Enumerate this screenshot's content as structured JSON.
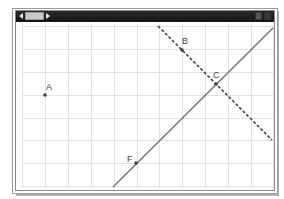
{
  "window": {
    "titlebar": {
      "background": "#1e1e1e",
      "scroll_left_icon": "triangle-left",
      "scroll_right_icon": "triangle-right",
      "buttons": [
        "minimize",
        "close"
      ]
    }
  },
  "canvas": {
    "grid": {
      "x_lines": [
        22,
        45,
        68,
        91,
        114,
        137,
        159,
        182,
        205,
        228,
        251,
        273
      ],
      "y_lines": [
        26,
        49,
        72,
        95,
        118,
        140,
        163,
        186
      ],
      "color": "#e2e2e2"
    },
    "lines": [
      {
        "name": "solid-line-FC",
        "x1": 113,
        "y1": 187,
        "x2": 273,
        "y2": 28,
        "style": "solid",
        "color": "#707070"
      },
      {
        "name": "dashed-line-BC",
        "x1": 158,
        "y1": 26,
        "x2": 272,
        "y2": 140,
        "style": "dashed",
        "color": "#404040"
      }
    ],
    "points": [
      {
        "label": "A",
        "x": 45,
        "y": 95,
        "lx": 46,
        "ly": 90
      },
      {
        "label": "B",
        "x": 182,
        "y": 50,
        "lx": 182,
        "ly": 44
      },
      {
        "label": "C",
        "x": 216,
        "y": 84,
        "lx": 213,
        "ly": 78
      },
      {
        "label": "F",
        "x": 136,
        "y": 163,
        "lx": 127,
        "ly": 162
      }
    ]
  }
}
